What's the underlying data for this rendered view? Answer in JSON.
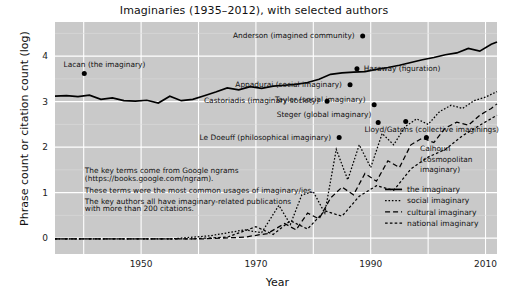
{
  "chart_data": {
    "type": "line",
    "title": "Imaginaries (1935–2012), with selected authors",
    "xlabel": "Year",
    "ylabel": "Phrase count or citation count (log)",
    "xlim": [
      1935,
      2012
    ],
    "ylim": [
      -0.35,
      4.75
    ],
    "xticks": [
      1950,
      1970,
      1990,
      2010
    ],
    "yticks": [
      0,
      1,
      2,
      3,
      4
    ],
    "grid": true,
    "legend_position": "bottom-right",
    "panel_color": "#c9c9c9",
    "grid_color": "#ffffff",
    "line_color": "#000000",
    "series": [
      {
        "name": "the imaginary",
        "style": "solid",
        "x": [
          1935,
          1937,
          1939,
          1941,
          1943,
          1945,
          1947,
          1949,
          1951,
          1953,
          1955,
          1957,
          1959,
          1961,
          1963,
          1965,
          1967,
          1969,
          1971,
          1973,
          1975,
          1977,
          1979,
          1981,
          1983,
          1985,
          1987,
          1989,
          1991,
          1993,
          1995,
          1997,
          1999,
          2001,
          2003,
          2005,
          2007,
          2009,
          2011,
          2012
        ],
        "values": [
          3.12,
          3.13,
          3.11,
          3.14,
          3.05,
          3.08,
          3.02,
          3.01,
          3.03,
          2.97,
          3.12,
          3.02,
          3.05,
          3.13,
          3.21,
          3.3,
          3.26,
          3.33,
          3.29,
          3.34,
          3.36,
          3.38,
          3.42,
          3.49,
          3.6,
          3.63,
          3.65,
          3.66,
          3.71,
          3.75,
          3.8,
          3.86,
          3.92,
          3.97,
          4.03,
          4.07,
          4.17,
          4.11,
          4.26,
          4.31
        ]
      },
      {
        "name": "social imaginary",
        "style": "dotted",
        "x": [
          1935,
          1945,
          1955,
          1962,
          1968,
          1971,
          1974,
          1976,
          1978,
          1980,
          1982,
          1984,
          1986,
          1988,
          1990,
          1992,
          1994,
          1996,
          1998,
          2000,
          2002,
          2004,
          2006,
          2008,
          2010,
          2012
        ],
        "values": [
          -0.02,
          -0.02,
          -0.02,
          0.05,
          0.18,
          0.12,
          0.72,
          0.3,
          0.95,
          1.02,
          0.55,
          1.95,
          1.28,
          2.05,
          1.55,
          2.3,
          2.05,
          2.45,
          2.62,
          2.5,
          2.78,
          2.92,
          2.85,
          3.02,
          3.1,
          3.22
        ]
      },
      {
        "name": "cultural imaginary",
        "style": "dashed",
        "x": [
          1935,
          1950,
          1960,
          1968,
          1972,
          1975,
          1977,
          1979,
          1981,
          1983,
          1985,
          1987,
          1989,
          1991,
          1993,
          1995,
          1997,
          1999,
          2001,
          2003,
          2005,
          2007,
          2009,
          2011,
          2012
        ],
        "values": [
          -0.02,
          -0.02,
          -0.02,
          0.02,
          0.1,
          0.32,
          0.18,
          0.55,
          0.42,
          0.88,
          1.12,
          0.95,
          1.42,
          1.25,
          1.7,
          1.55,
          2.05,
          2.2,
          2.1,
          2.42,
          2.55,
          2.48,
          2.7,
          2.85,
          2.95
        ]
      },
      {
        "name": "national imaginary",
        "style": "dashdot",
        "x": [
          1935,
          1948,
          1958,
          1965,
          1970,
          1973,
          1976,
          1979,
          1982,
          1985,
          1988,
          1991,
          1994,
          1997,
          2000,
          2003,
          2006,
          2009,
          2012
        ],
        "values": [
          -0.02,
          -0.02,
          -0.02,
          0.02,
          0.25,
          0.08,
          0.38,
          0.2,
          0.6,
          0.48,
          0.92,
          1.15,
          1.05,
          1.52,
          1.78,
          1.95,
          2.25,
          2.48,
          2.7
        ]
      }
    ],
    "annotations": [
      {
        "name": "anderson",
        "label": "Anderson (imagined community)",
        "anchor": "end",
        "text_x": 1987.2,
        "text_y": 4.46,
        "point_x": 1988.6,
        "point_y": 4.44
      },
      {
        "name": "lacan",
        "label": "Lacan (the imaginary)",
        "anchor": "start",
        "text_x": 1936.5,
        "text_y": 3.82,
        "point_x": 1940.1,
        "point_y": 3.62
      },
      {
        "name": "haraway",
        "label": "Haraway (figuration)",
        "anchor": "start",
        "text_x": 1988.8,
        "text_y": 3.73,
        "point_x": 1987.6,
        "point_y": 3.72
      },
      {
        "name": "appadurai",
        "label": "Appadurai (social imaginary)",
        "anchor": "end",
        "text_x": 1985.0,
        "text_y": 3.38,
        "point_x": 1986.4,
        "point_y": 3.37
      },
      {
        "name": "taylor",
        "label": "Taylor (social imaginary)",
        "anchor": "end",
        "text_x": 1989.1,
        "text_y": 3.05,
        "point_x": 1990.6,
        "point_y": 2.93
      },
      {
        "name": "castoriadis",
        "label": "Castoriadis (imaginary society)",
        "anchor": "end",
        "text_x": 1981.0,
        "text_y": 3.02,
        "point_x": 1982.4,
        "point_y": 3.01
      },
      {
        "name": "steger",
        "label": "Steger (global imaginary)",
        "anchor": "end",
        "text_x": 1990.1,
        "text_y": 2.72,
        "point_x": 1991.3,
        "point_y": 2.54
      },
      {
        "name": "lloyd-gatens",
        "label": "Lloyd/Gatens (collective imaginings)",
        "anchor": "start",
        "text_x": 1988.9,
        "text_y": 2.39,
        "point_x": 1996.1,
        "point_y": 2.56
      },
      {
        "name": "le-doeuff",
        "label": "Le Doeuff (philosophical imaginary)",
        "anchor": "end",
        "text_x": 1983.1,
        "text_y": 2.22,
        "point_x": 1984.5,
        "point_y": 2.21
      },
      {
        "name": "calhoun",
        "label": "Calhoun",
        "anchor": "start",
        "text_x": 1998.6,
        "text_y": 1.97,
        "point_x": 1999.7,
        "point_y": 2.21
      },
      {
        "name": "calhoun-line2",
        "label": "(cosmopolitan",
        "anchor": "start",
        "text_x": 1998.6,
        "text_y": 1.74,
        "point_x": null,
        "point_y": null
      },
      {
        "name": "calhoun-line3",
        "label": "imaginary)",
        "anchor": "start",
        "text_x": 1998.6,
        "text_y": 1.51,
        "point_x": null,
        "point_y": null
      }
    ],
    "notes": [
      "The key terms come from Google ngrams",
      "(https://books.google.com/ngram).",
      "These terms were the most common usages of imaginary/ies.",
      "The key authors all have imaginary-related publications",
      "with more than 200 citations."
    ]
  }
}
